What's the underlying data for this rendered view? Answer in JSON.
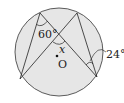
{
  "diagram": {
    "type": "inscribed-angles",
    "circle": {
      "cx": 59,
      "cy": 52,
      "r": 44,
      "fill": "#e6e6e6",
      "stroke": "#333333"
    },
    "points": {
      "A": [
        40,
        13
      ],
      "B": [
        77,
        13
      ],
      "C": [
        20,
        79
      ],
      "D": [
        97,
        77
      ]
    },
    "segments": [
      [
        "A",
        "C"
      ],
      [
        "A",
        "D"
      ],
      [
        "B",
        "C"
      ],
      [
        "B",
        "D"
      ]
    ],
    "center_label": "O",
    "labels": {
      "angle_A": "60°",
      "angle_x": "x",
      "angle_D": "24°",
      "center": "O"
    }
  }
}
